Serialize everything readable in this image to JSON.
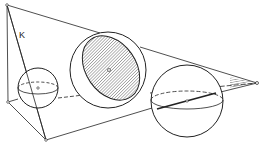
{
  "diagram": {
    "label_K": "K",
    "colors": {
      "stroke": "#222222",
      "background": "#ffffff"
    }
  }
}
